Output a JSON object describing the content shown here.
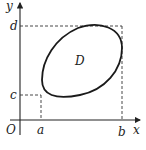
{
  "diagram": {
    "type": "region-in-coordinate-plane",
    "axes": {
      "x_label": "x",
      "y_label": "y",
      "origin_label": "O"
    },
    "region": {
      "label": "D",
      "shape": "tilted closed convex curve (ellipse-like)"
    },
    "bounds": {
      "x_min_label": "a",
      "x_max_label": "b",
      "y_min_label": "c",
      "y_max_label": "d"
    },
    "guide_lines": "dashed projections from region extremes to axes"
  }
}
